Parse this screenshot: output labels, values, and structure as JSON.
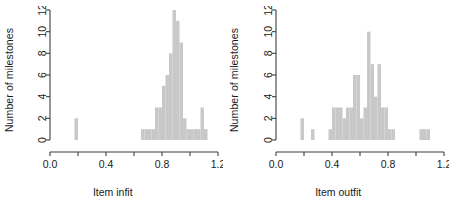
{
  "figure": {
    "background": "#ffffff",
    "bar_fill": "#c8c8c8",
    "axis_color": "#3d3d3d",
    "text_color": "#1a1a1a"
  },
  "chart_data": [
    {
      "type": "bar",
      "panel": "left",
      "title": "",
      "xlabel": "Item infit",
      "ylabel": "Number of milestones",
      "xlim": [
        0.0,
        1.2
      ],
      "ylim": [
        0,
        12
      ],
      "grid": false,
      "legend": null,
      "xticks": [
        0.0,
        0.2,
        0.4,
        0.6,
        0.8,
        1.0,
        1.2
      ],
      "xticklabels": [
        "0.0",
        "",
        "0.4",
        "",
        "0.8",
        "",
        "1.2"
      ],
      "yticks": [
        0,
        2,
        4,
        6,
        8,
        10,
        12
      ],
      "yticklabels": [
        "0",
        "2",
        "4",
        "6",
        "8",
        "10",
        "12"
      ],
      "bin_width": 0.025,
      "bins": [
        {
          "x0": 0.175,
          "x1": 0.2,
          "count": 2
        },
        {
          "x0": 0.65,
          "x1": 0.675,
          "count": 1
        },
        {
          "x0": 0.675,
          "x1": 0.7,
          "count": 1
        },
        {
          "x0": 0.7,
          "x1": 0.725,
          "count": 1
        },
        {
          "x0": 0.725,
          "x1": 0.75,
          "count": 1
        },
        {
          "x0": 0.75,
          "x1": 0.775,
          "count": 3
        },
        {
          "x0": 0.775,
          "x1": 0.8,
          "count": 3
        },
        {
          "x0": 0.8,
          "x1": 0.825,
          "count": 5
        },
        {
          "x0": 0.825,
          "x1": 0.85,
          "count": 6
        },
        {
          "x0": 0.85,
          "x1": 0.875,
          "count": 8
        },
        {
          "x0": 0.875,
          "x1": 0.9,
          "count": 12
        },
        {
          "x0": 0.9,
          "x1": 0.925,
          "count": 11
        },
        {
          "x0": 0.925,
          "x1": 0.95,
          "count": 9
        },
        {
          "x0": 0.95,
          "x1": 0.975,
          "count": 2
        },
        {
          "x0": 0.975,
          "x1": 1.0,
          "count": 1
        },
        {
          "x0": 1.0,
          "x1": 1.025,
          "count": 1
        },
        {
          "x0": 1.025,
          "x1": 1.05,
          "count": 1
        },
        {
          "x0": 1.05,
          "x1": 1.075,
          "count": 1
        },
        {
          "x0": 1.075,
          "x1": 1.1,
          "count": 3
        },
        {
          "x0": 1.1,
          "x1": 1.125,
          "count": 1
        }
      ]
    },
    {
      "type": "bar",
      "panel": "right",
      "title": "",
      "xlabel": "Item outfit",
      "ylabel": "Number of milestones",
      "xlim": [
        0.0,
        1.2
      ],
      "ylim": [
        0,
        12
      ],
      "grid": false,
      "legend": null,
      "xticks": [
        0.0,
        0.2,
        0.4,
        0.6,
        0.8,
        1.0,
        1.2
      ],
      "xticklabels": [
        "0.0",
        "",
        "0.4",
        "",
        "0.8",
        "",
        "1.2"
      ],
      "yticks": [
        0,
        2,
        4,
        6,
        8,
        10,
        12
      ],
      "yticklabels": [
        "0",
        "2",
        "4",
        "6",
        "8",
        "10",
        "12"
      ],
      "bin_width": 0.025,
      "bins": [
        {
          "x0": 0.175,
          "x1": 0.2,
          "count": 2
        },
        {
          "x0": 0.25,
          "x1": 0.275,
          "count": 1
        },
        {
          "x0": 0.375,
          "x1": 0.4,
          "count": 1
        },
        {
          "x0": 0.4,
          "x1": 0.425,
          "count": 3
        },
        {
          "x0": 0.425,
          "x1": 0.45,
          "count": 3
        },
        {
          "x0": 0.45,
          "x1": 0.475,
          "count": 3
        },
        {
          "x0": 0.475,
          "x1": 0.5,
          "count": 2
        },
        {
          "x0": 0.5,
          "x1": 0.525,
          "count": 3
        },
        {
          "x0": 0.525,
          "x1": 0.55,
          "count": 3
        },
        {
          "x0": 0.55,
          "x1": 0.575,
          "count": 6
        },
        {
          "x0": 0.575,
          "x1": 0.6,
          "count": 6
        },
        {
          "x0": 0.6,
          "x1": 0.625,
          "count": 2
        },
        {
          "x0": 0.625,
          "x1": 0.65,
          "count": 3
        },
        {
          "x0": 0.65,
          "x1": 0.675,
          "count": 10
        },
        {
          "x0": 0.675,
          "x1": 0.7,
          "count": 7
        },
        {
          "x0": 0.7,
          "x1": 0.725,
          "count": 4
        },
        {
          "x0": 0.725,
          "x1": 0.75,
          "count": 7
        },
        {
          "x0": 0.75,
          "x1": 0.775,
          "count": 3
        },
        {
          "x0": 0.775,
          "x1": 0.8,
          "count": 3
        },
        {
          "x0": 0.8,
          "x1": 0.825,
          "count": 1
        },
        {
          "x0": 0.825,
          "x1": 0.85,
          "count": 1
        },
        {
          "x0": 1.025,
          "x1": 1.05,
          "count": 1
        },
        {
          "x0": 1.05,
          "x1": 1.075,
          "count": 1
        },
        {
          "x0": 1.075,
          "x1": 1.1,
          "count": 1
        }
      ]
    }
  ]
}
